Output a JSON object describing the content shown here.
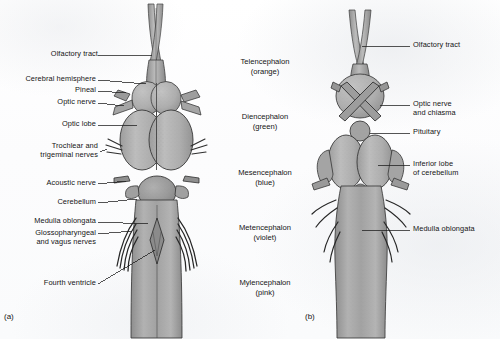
{
  "figure": {
    "panels": [
      {
        "id": "a",
        "letter": "(a)",
        "view": "dorsal"
      },
      {
        "id": "b",
        "letter": "(b)",
        "view": "ventral"
      }
    ]
  },
  "panel_a_labels": [
    {
      "name": "olfactory-tract",
      "lines": [
        "Olfactory tract"
      ]
    },
    {
      "name": "cerebral-hemisphere",
      "lines": [
        "Cerebral hemisphere"
      ]
    },
    {
      "name": "pineal",
      "lines": [
        "Pineal"
      ]
    },
    {
      "name": "optic-nerve",
      "lines": [
        "Optic nerve"
      ]
    },
    {
      "name": "optic-lobe",
      "lines": [
        "Optic lobe"
      ]
    },
    {
      "name": "trochlear-trigeminal-nerves",
      "lines": [
        "Trochlear and",
        "trigeminal nerves"
      ]
    },
    {
      "name": "acoustic-nerve",
      "lines": [
        "Acoustic nerve"
      ]
    },
    {
      "name": "cerebellum",
      "lines": [
        "Cerebellum"
      ]
    },
    {
      "name": "medulla-oblongata",
      "lines": [
        "Medulla oblongata"
      ]
    },
    {
      "name": "glossopharyngeal-vagus-nerves",
      "lines": [
        "Glossopharyngeal",
        "and vagus nerves"
      ]
    },
    {
      "name": "fourth-ventricle",
      "lines": [
        "Fourth ventricle"
      ]
    }
  ],
  "region_labels": [
    {
      "name": "telencephalon",
      "lines": [
        "Telencephalon",
        "(orange)"
      ]
    },
    {
      "name": "diencephalon",
      "lines": [
        "Diencephalon",
        "(green)"
      ]
    },
    {
      "name": "mesencephalon",
      "lines": [
        "Mesencephalon",
        "(blue)"
      ]
    },
    {
      "name": "metencephalon",
      "lines": [
        "Metencephalon",
        "(violet)"
      ]
    },
    {
      "name": "mylencephalon",
      "lines": [
        "Mylencephalon",
        "(pink)"
      ]
    }
  ],
  "panel_b_labels": [
    {
      "name": "olfactory-tract",
      "lines": [
        "Olfactory tract"
      ]
    },
    {
      "name": "optic-nerve-chiasma",
      "lines": [
        "Optic nerve",
        "and chiasma"
      ]
    },
    {
      "name": "pituitary",
      "lines": [
        "Pituitary"
      ]
    },
    {
      "name": "inferior-lobe-cerebellum",
      "lines": [
        "Inferior lobe",
        "of cerebellum"
      ]
    },
    {
      "name": "medulla-oblongata",
      "lines": [
        "Medulla oblongata"
      ]
    }
  ],
  "colors": {
    "ink": "#141414",
    "leader_line": "#1c1c1c",
    "tissue_light": "#b9b9b9",
    "tissue_mid": "#a6a6a6",
    "tissue_dark": "#8e8e8e",
    "outline": "#3a3a3a",
    "background": "#fdfdfd"
  }
}
